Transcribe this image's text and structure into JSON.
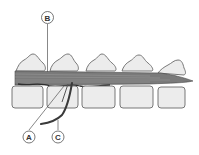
{
  "diagram": {
    "labels": [
      {
        "id": "B",
        "text": "B",
        "cx": 47.5,
        "cy": 17.5,
        "line": [
          47.5,
          24,
          47.5,
          72
        ]
      },
      {
        "id": "A",
        "text": "A",
        "cx": 29,
        "cy": 137,
        "line": [
          29,
          130,
          68,
          83
        ]
      },
      {
        "id": "C",
        "text": "C",
        "cx": 58,
        "cy": 137,
        "line": [
          58,
          130,
          72,
          83
        ]
      }
    ],
    "colors": {
      "bone_fill": "#ececec",
      "bone_stroke": "#6a6a6a",
      "cord_fill": "#7a7a7a",
      "cord_dark": "#3c3c3c",
      "label_stroke": "#555555"
    }
  }
}
